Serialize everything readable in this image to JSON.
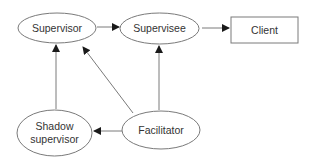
{
  "diagram": {
    "colors": {
      "stroke": "#7a7a7a",
      "arrow": "#1a1a1a",
      "text": "#333333",
      "background": "#ffffff"
    },
    "nodes": {
      "supervisor": {
        "label": "Supervisor",
        "shape": "ellipse"
      },
      "supervisee": {
        "label": "Supervisee",
        "shape": "ellipse"
      },
      "client": {
        "label": "Client",
        "shape": "rectangle"
      },
      "shadow_supervisor": {
        "label": "Shadow\nsupervisor",
        "shape": "ellipse"
      },
      "facilitator": {
        "label": "Facilitator",
        "shape": "ellipse"
      }
    },
    "edges": [
      {
        "from": "Supervisor",
        "to": "Supervisee"
      },
      {
        "from": "Supervisee",
        "to": "Client"
      },
      {
        "from": "Shadow supervisor",
        "to": "Supervisor"
      },
      {
        "from": "Facilitator",
        "to": "Supervisor"
      },
      {
        "from": "Facilitator",
        "to": "Supervisee"
      },
      {
        "from": "Facilitator",
        "to": "Shadow supervisor"
      }
    ]
  }
}
